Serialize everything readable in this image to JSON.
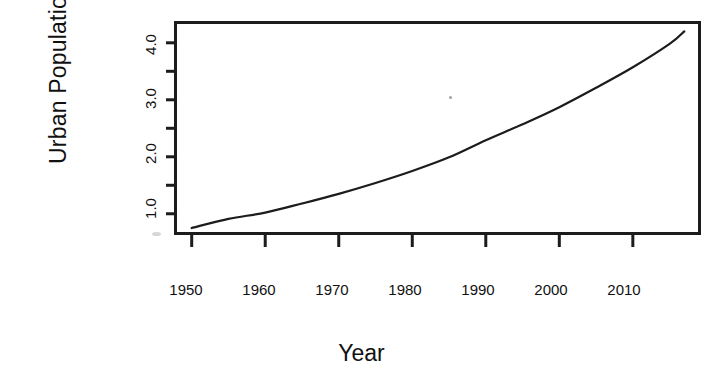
{
  "chart_data": {
    "type": "line",
    "title": "",
    "xlabel": "Year",
    "ylabel": "Urban Population",
    "xlim": [
      1948,
      2019
    ],
    "ylim": [
      0.68,
      4.33
    ],
    "grid": false,
    "legend": null,
    "xticks": [
      1950,
      1960,
      1970,
      1980,
      1990,
      2000,
      2010
    ],
    "xtick_labels": [
      "1950",
      "1960",
      "1970",
      "1980",
      "1990",
      "2000",
      "2010"
    ],
    "yticks": [
      1.0,
      1.5,
      2.0,
      2.5,
      3.0,
      3.5,
      4.0
    ],
    "ytick_labels": [
      "1.0",
      "",
      "2.0",
      "",
      "3.0",
      "",
      "4.0"
    ],
    "ytick_labels_shown": [
      "1.0",
      "2.0",
      "3.0",
      "4.0"
    ],
    "line_color": "#1c1c1c",
    "line_width": 2.2,
    "series": [
      {
        "name": "Urban Population",
        "x": [
          1950,
          1955,
          1960,
          1965,
          1970,
          1975,
          1980,
          1985,
          1990,
          1995,
          2000,
          2005,
          2010,
          2015,
          2017
        ],
        "values": [
          0.75,
          0.91,
          1.02,
          1.18,
          1.35,
          1.54,
          1.75,
          1.99,
          2.29,
          2.57,
          2.87,
          3.21,
          3.57,
          3.98,
          4.2
        ]
      }
    ]
  },
  "axis": {
    "y_title": "Urban Population",
    "x_title": "Year"
  },
  "figure": {
    "background": "#ffffff",
    "frame_color": "#1c1c1c"
  }
}
